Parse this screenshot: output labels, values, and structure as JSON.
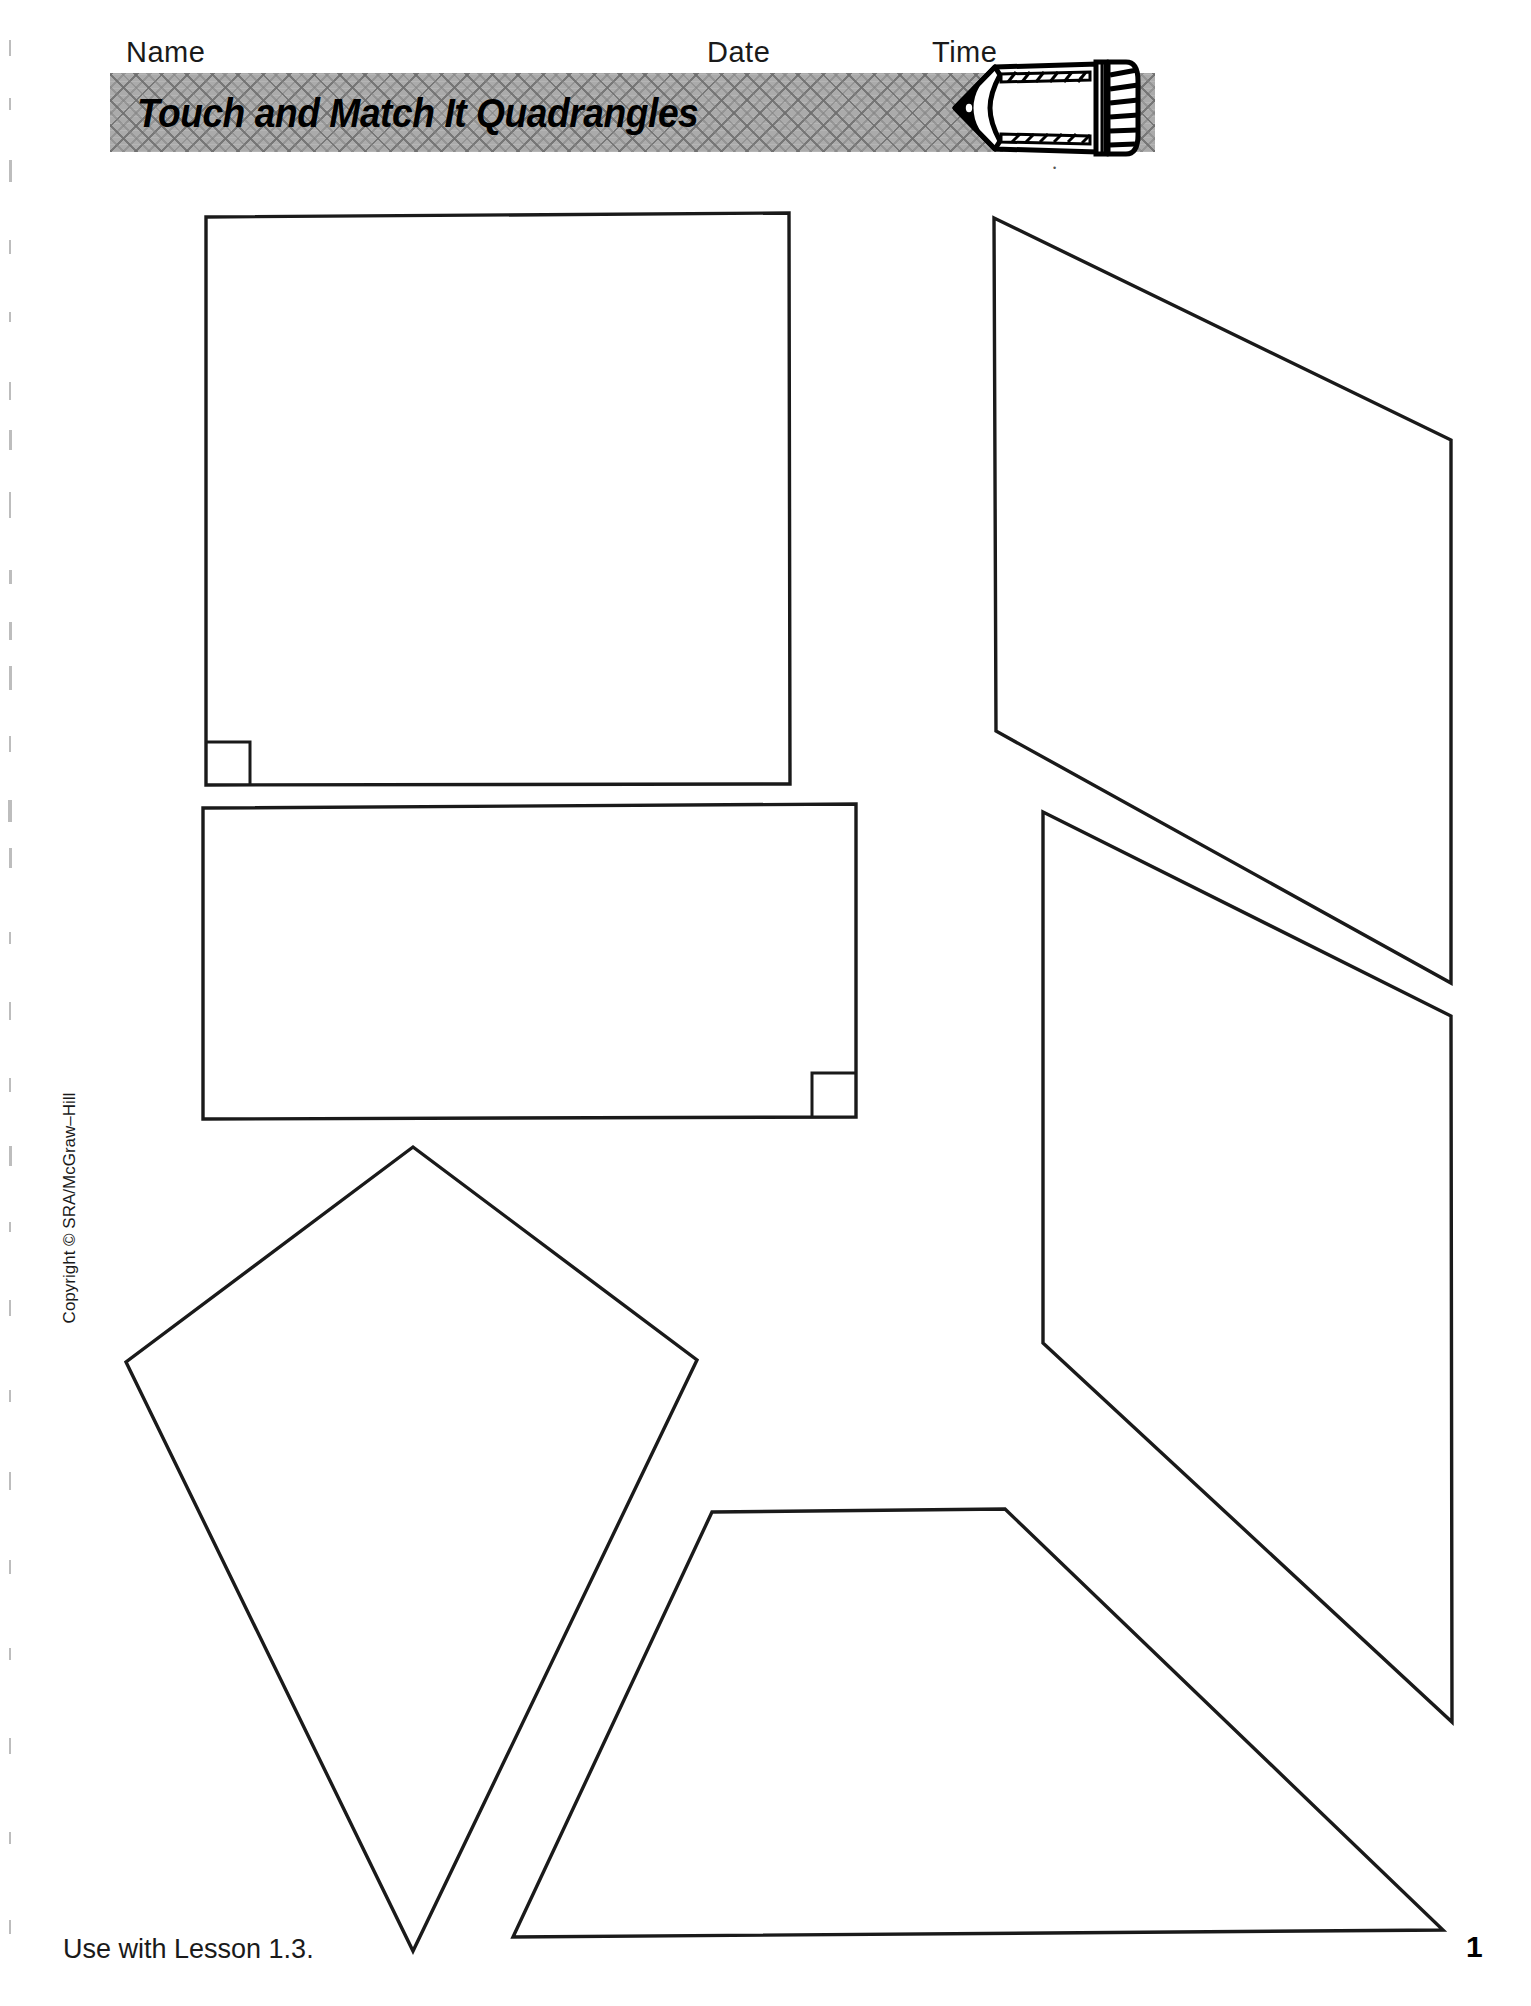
{
  "header": {
    "name_label": "Name",
    "date_label": "Date",
    "time_label": "Time",
    "banner_title": "Touch and Match It Quadrangles",
    "pencil_icon": "pencil-icon"
  },
  "footer": {
    "lesson_note": "Use with Lesson 1.3.",
    "page_number": "1",
    "copyright": "Copyright © SRA/McGraw–Hill"
  },
  "colors": {
    "ink": "#1a1a1a",
    "banner_gray": "#ababab",
    "banner_weave": "#6e6e6e",
    "paper": "#ffffff"
  },
  "shapes": [
    {
      "id": "square",
      "name": "square-quadrangle",
      "kind": "square",
      "points": "206,217 789,213 790,784 206,785",
      "right_angle_marker": "206,742 250,742 250,785"
    },
    {
      "id": "rectangle",
      "name": "rectangle-quadrangle",
      "kind": "rectangle",
      "points": "203,808 856,804 856,1117 203,1119",
      "right_angle_marker": "856,1073 812,1073 812,1117"
    },
    {
      "id": "trapezoid-upper-right",
      "name": "trapezoid-quadrangle-upper-right",
      "kind": "trapezoid",
      "points": "994,218 1451,440 1451,983 996,731"
    },
    {
      "id": "trapezoid-lower-right",
      "name": "trapezoid-quadrangle-lower-right",
      "kind": "trapezoid",
      "points": "1043,812 1451,1016 1452,1722 1043,1343"
    },
    {
      "id": "kite",
      "name": "kite-quadrangle",
      "kind": "kite",
      "points": "413,1147 697,1360 413,1951 126,1362"
    },
    {
      "id": "trapezoid-bottom",
      "name": "trapezoid-quadrangle-bottom",
      "kind": "trapezoid",
      "points": "712,1512 1005,1509 1443,1930 513,1937"
    }
  ]
}
